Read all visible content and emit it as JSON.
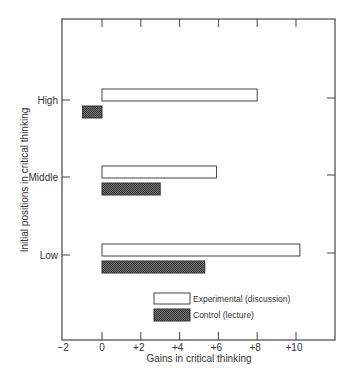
{
  "chart_data": {
    "type": "bar",
    "orientation": "horizontal",
    "title": "",
    "xlabel": "Gains in critical thinking",
    "ylabel": "Initial positions in critical thinking",
    "xlim": [
      -2,
      12
    ],
    "xticks": [
      -2,
      0,
      2,
      4,
      6,
      8,
      10
    ],
    "xtick_labels": [
      "−2",
      "0",
      "+2",
      "+4",
      "+6",
      "+8",
      "+10"
    ],
    "categories": [
      "High",
      "Middle",
      "Low"
    ],
    "series": [
      {
        "name": "Experimental (discussion)",
        "color": "#ffffff",
        "values": [
          8.0,
          5.9,
          10.2
        ]
      },
      {
        "name": "Control (lecture)",
        "color": "#555555",
        "values": [
          -1.0,
          3.0,
          5.3
        ]
      }
    ],
    "grid": false,
    "legend_position": "lower center inside plot"
  },
  "legend": {
    "experimental": "Experimental (discussion)",
    "control": "Control (lecture)"
  }
}
